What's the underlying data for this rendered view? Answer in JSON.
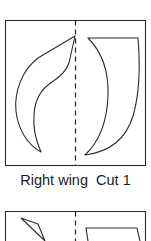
{
  "document": {
    "type": "sewing-pattern-sheet",
    "background_color": "#ffffff",
    "ink_color": "#2b2b2b"
  },
  "panels": [
    {
      "id": "panel-right-wing",
      "box": {
        "x": 5,
        "y": 20,
        "width": 141,
        "height": 146
      },
      "fold_line": {
        "name": "fold-line",
        "orientation": "vertical",
        "x": 75,
        "style": "dashed",
        "dash": "5,4"
      },
      "label": {
        "text": "Right wing  Cut 1",
        "part_name": "Right wing",
        "cut_instruction": "Cut 1",
        "cut_quantity": 1
      },
      "pieces": [
        {
          "name": "left-leaf-shape",
          "description": "concave leaf / flame outline, tip touching the fold line at top right",
          "path": "M 75 36 L 38 58 C 22 70 14 92 16 111 C 18 130 28 145 41 152 C 36 141 33 126 34 114 C 35 100 41 89 52 82 C 60 77 66 71 69 63 Z"
        },
        {
          "name": "right-crescent-shape",
          "description": "crescent wing outline mirrored across the fold, bottom point at left",
          "path": "M 88 38 L 138 38 C 140 62 140 92 133 116 C 126 139 109 152 85 155 C 99 142 107 121 108 96 C 109 69 100 50 88 38 Z"
        }
      ]
    },
    {
      "id": "panel-next-partial",
      "box": {
        "x": 5,
        "y": 211,
        "width": 141,
        "height": 30
      },
      "fold_line": {
        "name": "fold-line",
        "orientation": "vertical",
        "x": 75,
        "style": "dashed",
        "dash": "5,4"
      },
      "label": {
        "text": ""
      },
      "pieces": [
        {
          "name": "left-partial-arrow-shape",
          "description": "top of a narrow pointed shape entering from the panel top-left",
          "path": "M 22 219 L 44 241 L 38 222 Z"
        },
        {
          "name": "right-partial-shape",
          "description": "top edge of the next crescent piece",
          "path": "M 88 241 L 86 228 L 137 228 L 139 241"
        }
      ]
    }
  ]
}
